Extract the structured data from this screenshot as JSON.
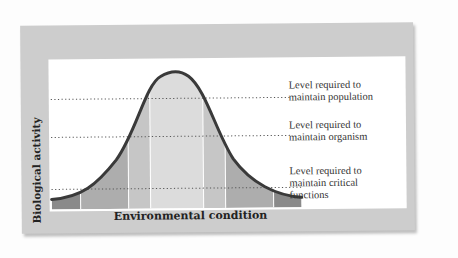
{
  "diagram": {
    "type": "tolerance-curve",
    "y_axis_label": "Biological activity",
    "x_axis_label": "Environmental condition",
    "levels": [
      {
        "id": "population",
        "line1": "Level required to",
        "line2": "maintain population",
        "line3": ""
      },
      {
        "id": "organism",
        "line1": "Level required to",
        "line2": "maintain organism",
        "line3": ""
      },
      {
        "id": "critical",
        "line1": "Level required to",
        "line2": "maintain critical",
        "line3": "functions"
      }
    ],
    "colors": {
      "frame": "#cdcdcd",
      "panel": "#ffffff",
      "curve": "#3a3a3a",
      "zone_outer": "#8a8a8a",
      "zone_middle": "#adadad",
      "zone_inner": "#c6c6c6",
      "zone_optimum": "#dcdcdc",
      "dotted_line": "#555555"
    }
  }
}
